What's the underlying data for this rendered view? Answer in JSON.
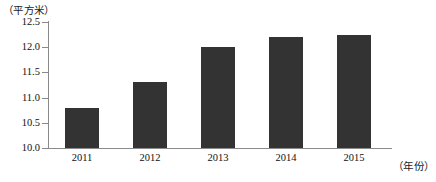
{
  "chart_data": {
    "type": "bar",
    "title": "",
    "subtitle": "",
    "categories": [
      "2011",
      "2012",
      "2013",
      "2014",
      "2015"
    ],
    "values": [
      10.8,
      11.3,
      12.0,
      12.2,
      12.25
    ],
    "series": [
      {
        "name": "人均住房面积",
        "values": [
          10.8,
          11.3,
          12.0,
          12.2,
          12.25
        ]
      }
    ],
    "xlabel": "（年份）",
    "ylabel": "（平方米）",
    "ylim": [
      10.0,
      12.5
    ],
    "ytick_labels": [
      "12.5",
      "12.0",
      "11.5",
      "11.0",
      "10.5",
      "10.0"
    ],
    "ytick_values": [
      12.5,
      12.0,
      11.5,
      11.0,
      10.5,
      10.0
    ],
    "grid": false,
    "legend": false,
    "legend_position": "none",
    "bar_color": "#333333",
    "axis_color": "#8a8a8a",
    "annotations": []
  },
  "axes": {
    "y_unit_caption": "（平方米）",
    "x_unit_caption": "（年份）"
  }
}
